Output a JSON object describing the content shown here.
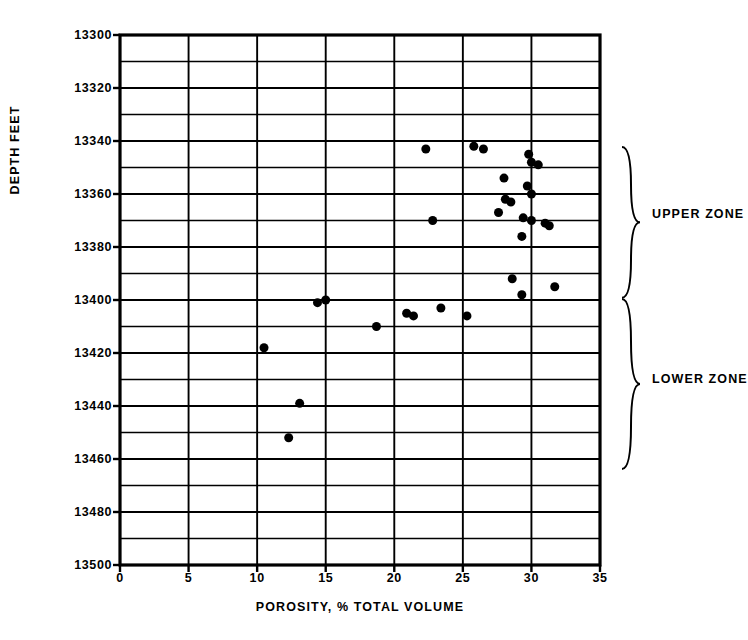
{
  "chart_data": {
    "type": "scatter",
    "title": "",
    "xlabel": "POROSITY, % TOTAL VOLUME",
    "ylabel": "DEPTH FEET",
    "xlim": [
      0,
      35
    ],
    "ylim": [
      13500,
      13300
    ],
    "y_inverted": true,
    "xticks": [
      0,
      5,
      10,
      15,
      20,
      25,
      30,
      35
    ],
    "xtick_labels": [
      "0",
      "5",
      "10",
      "15",
      "20",
      "25",
      "30",
      "35"
    ],
    "yticks": [
      13300,
      13320,
      13340,
      13360,
      13380,
      13400,
      13420,
      13440,
      13460,
      13480,
      13500
    ],
    "ytick_labels": [
      "13300",
      "13320",
      "13340",
      "13360",
      "13380",
      "13400",
      "13420",
      "13440",
      "13460",
      "13480",
      "13500"
    ],
    "grid": true,
    "grid_x_step": 5,
    "grid_y_step": 10,
    "marker": "filled-circle",
    "marker_color": "#000000",
    "marker_size": 9,
    "legend": null,
    "series": [
      {
        "name": "Porosity vs Depth",
        "points": [
          {
            "x": 22.3,
            "y": 13343,
            "zone": "UPPER ZONE"
          },
          {
            "x": 25.8,
            "y": 13342,
            "zone": "UPPER ZONE"
          },
          {
            "x": 26.5,
            "y": 13343,
            "zone": "UPPER ZONE"
          },
          {
            "x": 29.8,
            "y": 13345,
            "zone": "UPPER ZONE"
          },
          {
            "x": 30.0,
            "y": 13348,
            "zone": "UPPER ZONE"
          },
          {
            "x": 30.5,
            "y": 13349,
            "zone": "UPPER ZONE"
          },
          {
            "x": 28.0,
            "y": 13354,
            "zone": "UPPER ZONE"
          },
          {
            "x": 29.7,
            "y": 13357,
            "zone": "UPPER ZONE"
          },
          {
            "x": 30.0,
            "y": 13360,
            "zone": "UPPER ZONE"
          },
          {
            "x": 28.1,
            "y": 13362,
            "zone": "UPPER ZONE"
          },
          {
            "x": 28.5,
            "y": 13363,
            "zone": "UPPER ZONE"
          },
          {
            "x": 27.6,
            "y": 13367,
            "zone": "UPPER ZONE"
          },
          {
            "x": 22.8,
            "y": 13370,
            "zone": "UPPER ZONE"
          },
          {
            "x": 29.4,
            "y": 13369,
            "zone": "UPPER ZONE"
          },
          {
            "x": 30.0,
            "y": 13370,
            "zone": "UPPER ZONE"
          },
          {
            "x": 31.0,
            "y": 13371,
            "zone": "UPPER ZONE"
          },
          {
            "x": 31.3,
            "y": 13372,
            "zone": "UPPER ZONE"
          },
          {
            "x": 29.3,
            "y": 13376,
            "zone": "UPPER ZONE"
          },
          {
            "x": 28.6,
            "y": 13392,
            "zone": "UPPER ZONE"
          },
          {
            "x": 29.3,
            "y": 13398,
            "zone": "UPPER ZONE"
          },
          {
            "x": 31.7,
            "y": 13395,
            "zone": "UPPER ZONE"
          },
          {
            "x": 14.4,
            "y": 13401,
            "zone": "LOWER ZONE"
          },
          {
            "x": 15.0,
            "y": 13400,
            "zone": "LOWER ZONE"
          },
          {
            "x": 20.9,
            "y": 13405,
            "zone": "LOWER ZONE"
          },
          {
            "x": 21.4,
            "y": 13406,
            "zone": "LOWER ZONE"
          },
          {
            "x": 23.4,
            "y": 13403,
            "zone": "LOWER ZONE"
          },
          {
            "x": 25.3,
            "y": 13406,
            "zone": "LOWER ZONE"
          },
          {
            "x": 18.7,
            "y": 13410,
            "zone": "LOWER ZONE"
          },
          {
            "x": 10.5,
            "y": 13418,
            "zone": "LOWER ZONE"
          },
          {
            "x": 13.1,
            "y": 13439,
            "zone": "LOWER ZONE"
          },
          {
            "x": 12.3,
            "y": 13452,
            "zone": "LOWER ZONE"
          }
        ]
      }
    ],
    "annotations": [
      {
        "label": "UPPER ZONE",
        "depth_from": 13343,
        "depth_to": 13398,
        "brace": "right"
      },
      {
        "label": "LOWER ZONE",
        "depth_from": 13400,
        "depth_to": 13463,
        "brace": "right"
      }
    ]
  },
  "axes": {
    "y_title": "DEPTH FEET",
    "x_title": "POROSITY, % TOTAL VOLUME"
  },
  "zones": {
    "upper": "UPPER ZONE",
    "lower": "LOWER ZONE"
  },
  "colors": {
    "ink": "#000000",
    "background": "#ffffff"
  }
}
